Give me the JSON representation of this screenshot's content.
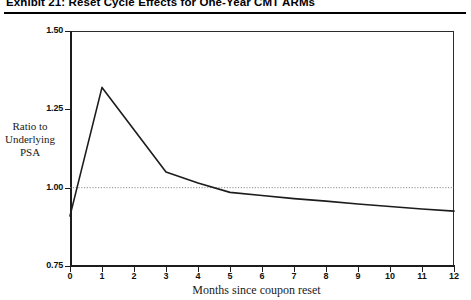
{
  "exhibit": {
    "title": "Exhibit 21: Reset Cycle Effects for One-Year CMT ARMs"
  },
  "chart_data": {
    "type": "line",
    "title": "Exhibit 21: Reset Cycle Effects for One-Year CMT ARMs",
    "xlabel": "Months since coupon reset",
    "ylabel": "Ratio to Underlying PSA",
    "ylabel_lines": [
      "Ratio to",
      "Underlying",
      "PSA"
    ],
    "x": [
      0,
      1,
      2,
      3,
      4,
      5,
      6,
      7,
      8,
      9,
      10,
      11,
      12
    ],
    "values": [
      0.91,
      1.32,
      1.185,
      1.05,
      1.015,
      0.985,
      0.975,
      0.965,
      0.957,
      0.948,
      0.94,
      0.932,
      0.925
    ],
    "series": [
      {
        "name": "Ratio to Underlying PSA",
        "values": [
          0.91,
          1.32,
          1.185,
          1.05,
          1.015,
          0.985,
          0.975,
          0.965,
          0.957,
          0.948,
          0.94,
          0.932,
          0.925
        ]
      }
    ],
    "reference_line": {
      "y": 1.0,
      "style": "dotted"
    },
    "xlim": [
      0,
      12
    ],
    "ylim": [
      0.75,
      1.5
    ],
    "xticks": [
      "0",
      "1",
      "2",
      "3",
      "4",
      "5",
      "6",
      "7",
      "8",
      "9",
      "10",
      "11",
      "12"
    ],
    "yticks": [
      "0.75",
      "1.00",
      "1.25",
      "1.50"
    ],
    "ytick_values": [
      0.75,
      1.0,
      1.25,
      1.5
    ],
    "grid": false,
    "legend": "none",
    "line_color": "#1c1c1c"
  }
}
